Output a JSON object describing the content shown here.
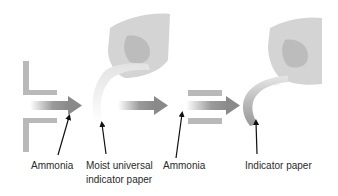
{
  "diagram": {
    "panels": [
      {
        "id": "before",
        "elements": [
          "tube-walls",
          "ammonia-flow-arrow",
          "hand",
          "moist-universal-indicator-paper"
        ]
      },
      {
        "id": "after",
        "elements": [
          "tube-walls",
          "ammonia-flow-arrow",
          "hand",
          "indicator-paper"
        ]
      }
    ],
    "labels": [
      {
        "id": "ammonia_1",
        "text": "Ammonia"
      },
      {
        "id": "moist_paper_line1",
        "text": "Moist universal"
      },
      {
        "id": "moist_paper_line2",
        "text": "indicator paper"
      },
      {
        "id": "ammonia_2",
        "text": "Ammonia"
      },
      {
        "id": "indicator_paper",
        "text": "Indicator paper"
      }
    ],
    "colors": {
      "tube": "#b9b9b9",
      "arrow": "#8f8f8f",
      "hand": "#d4d4d4",
      "hand_shadow": "#bcbcbc",
      "paper_moist": "#f0f0f0",
      "paper_changed": "#a8a8a8",
      "pointer": "#111111"
    }
  }
}
